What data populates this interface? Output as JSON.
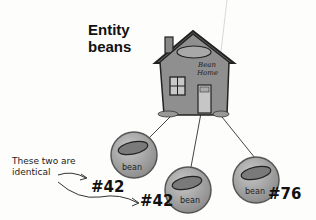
{
  "title": {
    "line1": "Entity",
    "line2": "beans"
  },
  "home": {
    "label_line1": "Bean",
    "label_line2": "Home"
  },
  "beans": [
    {
      "label": "bean",
      "id": "#42"
    },
    {
      "label": "bean",
      "id": "#42"
    },
    {
      "label": "bean",
      "id": "#76"
    }
  ],
  "annotation": {
    "line1": "These two are",
    "line2": "identical"
  },
  "colors": {
    "house": "#8a8a8a",
    "bean_ball": "#a6a6a6",
    "ink": "#1a1a1a"
  }
}
